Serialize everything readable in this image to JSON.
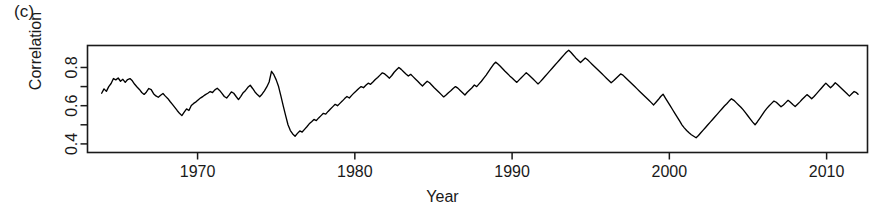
{
  "panel": {
    "label": "(c)"
  },
  "axes": {
    "ylabel": "Correlation",
    "xlabel": "Year",
    "y_ticks": [
      "0.4",
      "0.6",
      "0.8"
    ],
    "y_tick_values": [
      0.4,
      0.5,
      0.6,
      0.7,
      0.8
    ],
    "x_ticks": [
      "1970",
      "1980",
      "1990",
      "2000",
      "2010"
    ],
    "x_tick_values": [
      1970,
      1980,
      1990,
      2000,
      2010
    ]
  },
  "chart_data": {
    "type": "line",
    "title": "(c)",
    "xlabel": "Year",
    "ylabel": "Correlation",
    "xlim": [
      1963.0,
      2012.6
    ],
    "ylim": [
      0.355,
      0.915
    ],
    "grid": false,
    "legend": null,
    "line_color": "#000000",
    "series": [
      {
        "name": "Correlation",
        "x": [
          1963.9,
          1964.05,
          1964.2,
          1964.35,
          1964.5,
          1964.65,
          1964.8,
          1964.95,
          1965.1,
          1965.25,
          1965.4,
          1965.55,
          1965.7,
          1965.85,
          1966.0,
          1966.15,
          1966.3,
          1966.45,
          1966.6,
          1966.75,
          1966.9,
          1967.05,
          1967.2,
          1967.35,
          1967.5,
          1967.65,
          1967.8,
          1967.95,
          1968.1,
          1968.25,
          1968.4,
          1968.55,
          1968.7,
          1968.85,
          1969.0,
          1969.15,
          1969.3,
          1969.45,
          1969.6,
          1969.75,
          1969.9,
          1970.05,
          1970.2,
          1970.35,
          1970.5,
          1970.65,
          1970.8,
          1970.95,
          1971.1,
          1971.25,
          1971.4,
          1971.55,
          1971.7,
          1971.85,
          1972.0,
          1972.15,
          1972.3,
          1972.45,
          1972.6,
          1972.75,
          1972.9,
          1973.05,
          1973.2,
          1973.35,
          1973.5,
          1973.65,
          1973.8,
          1973.95,
          1974.1,
          1974.25,
          1974.4,
          1974.55,
          1974.7,
          1974.85,
          1975.0,
          1975.15,
          1975.3,
          1975.45,
          1975.6,
          1975.75,
          1975.9,
          1976.05,
          1976.2,
          1976.35,
          1976.5,
          1976.65,
          1976.8,
          1976.95,
          1977.1,
          1977.25,
          1977.4,
          1977.55,
          1977.7,
          1977.85,
          1978.0,
          1978.15,
          1978.3,
          1978.45,
          1978.6,
          1978.75,
          1978.9,
          1979.05,
          1979.2,
          1979.35,
          1979.5,
          1979.65,
          1979.8,
          1979.95,
          1980.1,
          1980.25,
          1980.4,
          1980.55,
          1980.7,
          1980.85,
          1981.0,
          1981.15,
          1981.3,
          1981.45,
          1981.6,
          1981.75,
          1981.9,
          1982.05,
          1982.2,
          1982.35,
          1982.5,
          1982.65,
          1982.8,
          1982.95,
          1983.1,
          1983.25,
          1983.4,
          1983.55,
          1983.7,
          1983.85,
          1984.0,
          1984.15,
          1984.3,
          1984.45,
          1984.6,
          1984.75,
          1984.9,
          1985.05,
          1985.2,
          1985.35,
          1985.5,
          1985.65,
          1985.8,
          1985.95,
          1986.1,
          1986.25,
          1986.4,
          1986.55,
          1986.7,
          1986.85,
          1987.0,
          1987.15,
          1987.3,
          1987.45,
          1987.6,
          1987.75,
          1987.9,
          1988.05,
          1988.2,
          1988.35,
          1988.5,
          1988.65,
          1988.8,
          1988.95,
          1989.1,
          1989.25,
          1989.4,
          1989.55,
          1989.7,
          1989.85,
          1990.0,
          1990.15,
          1990.3,
          1990.45,
          1990.6,
          1990.75,
          1990.9,
          1991.05,
          1991.2,
          1991.35,
          1991.5,
          1991.65,
          1991.8,
          1991.95,
          1992.1,
          1992.25,
          1992.4,
          1992.55,
          1992.7,
          1992.85,
          1993.0,
          1993.15,
          1993.3,
          1993.45,
          1993.6,
          1993.75,
          1993.9,
          1994.05,
          1994.2,
          1994.35,
          1994.5,
          1994.65,
          1994.8,
          1994.95,
          1995.1,
          1995.25,
          1995.4,
          1995.55,
          1995.7,
          1995.85,
          1996.0,
          1996.15,
          1996.3,
          1996.45,
          1996.6,
          1996.75,
          1996.9,
          1997.05,
          1997.2,
          1997.35,
          1997.5,
          1997.65,
          1997.8,
          1997.95,
          1998.1,
          1998.25,
          1998.4,
          1998.55,
          1998.7,
          1998.85,
          1999.0,
          1999.15,
          1999.3,
          1999.45,
          1999.6,
          1999.75,
          1999.9,
          2000.05,
          2000.2,
          2000.35,
          2000.5,
          2000.65,
          2000.8,
          2000.95,
          2001.1,
          2001.25,
          2001.4,
          2001.55,
          2001.7,
          2001.85,
          2002.0,
          2002.15,
          2002.3,
          2002.45,
          2002.6,
          2002.75,
          2002.9,
          2003.05,
          2003.2,
          2003.35,
          2003.5,
          2003.65,
          2003.8,
          2003.95,
          2004.1,
          2004.25,
          2004.4,
          2004.55,
          2004.7,
          2004.85,
          2005.0,
          2005.15,
          2005.3,
          2005.45,
          2005.6,
          2005.75,
          2005.9,
          2006.05,
          2006.2,
          2006.35,
          2006.5,
          2006.65,
          2006.8,
          2006.95,
          2007.1,
          2007.25,
          2007.4,
          2007.55,
          2007.7,
          2007.85,
          2008.0,
          2008.15,
          2008.3,
          2008.45,
          2008.6,
          2008.75,
          2008.9,
          2009.05,
          2009.2,
          2009.35,
          2009.5,
          2009.65,
          2009.8,
          2009.95,
          2010.1,
          2010.25,
          2010.4,
          2010.55,
          2010.7,
          2010.85,
          2011.0,
          2011.15,
          2011.3,
          2011.45,
          2011.6,
          2011.75,
          2011.9,
          2012.0
        ],
        "y": [
          0.665,
          0.688,
          0.675,
          0.7,
          0.716,
          0.742,
          0.735,
          0.745,
          0.728,
          0.738,
          0.722,
          0.737,
          0.742,
          0.73,
          0.712,
          0.698,
          0.685,
          0.669,
          0.659,
          0.672,
          0.69,
          0.684,
          0.663,
          0.651,
          0.644,
          0.655,
          0.664,
          0.65,
          0.638,
          0.622,
          0.607,
          0.591,
          0.575,
          0.56,
          0.548,
          0.566,
          0.583,
          0.575,
          0.601,
          0.612,
          0.62,
          0.631,
          0.641,
          0.649,
          0.658,
          0.665,
          0.674,
          0.669,
          0.683,
          0.691,
          0.68,
          0.664,
          0.648,
          0.64,
          0.655,
          0.672,
          0.665,
          0.648,
          0.632,
          0.649,
          0.668,
          0.68,
          0.696,
          0.707,
          0.69,
          0.672,
          0.658,
          0.647,
          0.66,
          0.678,
          0.698,
          0.724,
          0.78,
          0.762,
          0.735,
          0.7,
          0.65,
          0.598,
          0.548,
          0.5,
          0.47,
          0.452,
          0.44,
          0.455,
          0.468,
          0.462,
          0.476,
          0.49,
          0.505,
          0.516,
          0.528,
          0.522,
          0.536,
          0.548,
          0.56,
          0.556,
          0.57,
          0.583,
          0.595,
          0.607,
          0.6,
          0.612,
          0.624,
          0.637,
          0.648,
          0.64,
          0.654,
          0.667,
          0.678,
          0.69,
          0.7,
          0.694,
          0.707,
          0.718,
          0.712,
          0.724,
          0.737,
          0.748,
          0.76,
          0.772,
          0.766,
          0.755,
          0.744,
          0.758,
          0.775,
          0.788,
          0.8,
          0.79,
          0.778,
          0.766,
          0.755,
          0.764,
          0.752,
          0.74,
          0.728,
          0.715,
          0.703,
          0.716,
          0.728,
          0.72,
          0.707,
          0.694,
          0.682,
          0.67,
          0.658,
          0.646,
          0.656,
          0.668,
          0.678,
          0.69,
          0.7,
          0.692,
          0.68,
          0.668,
          0.656,
          0.67,
          0.682,
          0.694,
          0.708,
          0.7,
          0.714,
          0.728,
          0.744,
          0.76,
          0.778,
          0.796,
          0.814,
          0.828,
          0.818,
          0.806,
          0.793,
          0.78,
          0.768,
          0.756,
          0.745,
          0.733,
          0.722,
          0.735,
          0.748,
          0.76,
          0.772,
          0.762,
          0.75,
          0.738,
          0.726,
          0.714,
          0.726,
          0.74,
          0.754,
          0.768,
          0.782,
          0.796,
          0.81,
          0.824,
          0.838,
          0.852,
          0.866,
          0.88,
          0.89,
          0.878,
          0.864,
          0.85,
          0.838,
          0.826,
          0.838,
          0.85,
          0.84,
          0.828,
          0.816,
          0.804,
          0.792,
          0.78,
          0.768,
          0.756,
          0.744,
          0.732,
          0.72,
          0.73,
          0.742,
          0.754,
          0.766,
          0.76,
          0.748,
          0.736,
          0.724,
          0.712,
          0.7,
          0.688,
          0.676,
          0.664,
          0.652,
          0.64,
          0.628,
          0.616,
          0.604,
          0.618,
          0.632,
          0.648,
          0.66,
          0.64,
          0.62,
          0.6,
          0.58,
          0.56,
          0.54,
          0.52,
          0.5,
          0.484,
          0.47,
          0.458,
          0.448,
          0.44,
          0.432,
          0.444,
          0.458,
          0.472,
          0.486,
          0.5,
          0.514,
          0.528,
          0.542,
          0.556,
          0.57,
          0.584,
          0.598,
          0.61,
          0.624,
          0.636,
          0.628,
          0.616,
          0.604,
          0.592,
          0.578,
          0.562,
          0.546,
          0.53,
          0.514,
          0.5,
          0.516,
          0.534,
          0.552,
          0.57,
          0.586,
          0.6,
          0.612,
          0.624,
          0.618,
          0.606,
          0.594,
          0.604,
          0.616,
          0.628,
          0.618,
          0.606,
          0.596,
          0.608,
          0.62,
          0.634,
          0.646,
          0.658,
          0.648,
          0.636,
          0.648,
          0.662,
          0.676,
          0.69,
          0.704,
          0.718,
          0.706,
          0.694,
          0.706,
          0.72,
          0.71,
          0.698,
          0.686,
          0.674,
          0.662,
          0.65,
          0.662,
          0.674,
          0.668,
          0.66
        ]
      }
    ]
  }
}
